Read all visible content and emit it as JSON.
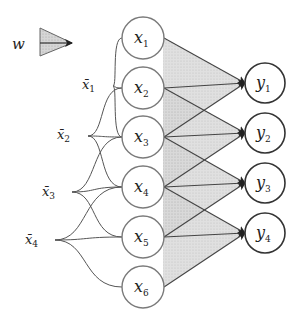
{
  "legend": {
    "label": "w",
    "meaning": "shared weight kernel"
  },
  "inputs": [
    {
      "base": "x",
      "sub": "1",
      "cy": 38
    },
    {
      "base": "x",
      "sub": "2",
      "cy": 88
    },
    {
      "base": "x",
      "sub": "3",
      "cy": 137
    },
    {
      "base": "x",
      "sub": "4",
      "cy": 187
    },
    {
      "base": "x",
      "sub": "5",
      "cy": 237
    },
    {
      "base": "x",
      "sub": "6",
      "cy": 287
    }
  ],
  "outputs": [
    {
      "base": "y",
      "sub": "1",
      "cy": 83
    },
    {
      "base": "y",
      "sub": "2",
      "cy": 133
    },
    {
      "base": "y",
      "sub": "3",
      "cy": 183
    },
    {
      "base": "y",
      "sub": "4",
      "cy": 233
    }
  ],
  "windows": [
    {
      "base": "x̄",
      "sub": "1",
      "lx": 82,
      "ly": 89,
      "px": 113,
      "py": 86
    },
    {
      "base": "x̄",
      "sub": "2",
      "lx": 57,
      "ly": 139,
      "px": 88,
      "py": 136
    },
    {
      "base": "x̄",
      "sub": "3",
      "lx": 42,
      "ly": 196,
      "px": 72,
      "py": 192
    },
    {
      "base": "x̄",
      "sub": "4",
      "lx": 25,
      "ly": 244,
      "px": 55,
      "py": 240
    }
  ],
  "colors": {
    "stroke": "#7a7a7a",
    "output_stroke": "#333333",
    "shade": "#bdbdbd",
    "arrow": "#333333"
  }
}
